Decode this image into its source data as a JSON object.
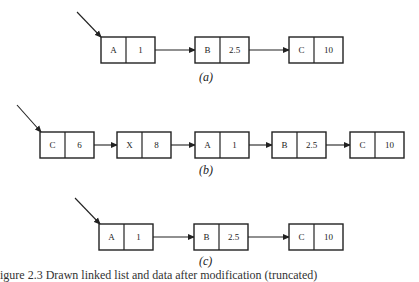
{
  "diagram": {
    "colors": {
      "stroke": "#222222",
      "background": "#ffffff"
    },
    "panels": [
      {
        "label": "(a)",
        "head_pointer": {
          "from": [
            77,
            12
          ],
          "to": [
            101,
            37
          ]
        },
        "row_y": 37,
        "nodes": [
          {
            "key": "A",
            "value": "1",
            "x": 101
          },
          {
            "key": "B",
            "value": "2.5",
            "x": 195
          },
          {
            "key": "C",
            "value": "10",
            "x": 289
          }
        ]
      },
      {
        "label": "(b)",
        "head_pointer": {
          "from": [
            17,
            105
          ],
          "to": [
            41,
            132
          ]
        },
        "row_y": 132,
        "nodes": [
          {
            "key": "C",
            "value": "6",
            "x": 40
          },
          {
            "key": "X",
            "value": "8",
            "x": 117
          },
          {
            "key": "A",
            "value": "1",
            "x": 195
          },
          {
            "key": "B",
            "value": "2.5",
            "x": 272
          },
          {
            "key": "C",
            "value": "10",
            "x": 350
          }
        ]
      },
      {
        "label": "(c)",
        "head_pointer": {
          "from": [
            75,
            198
          ],
          "to": [
            100,
            224
          ]
        },
        "row_y": 224,
        "nodes": [
          {
            "key": "A",
            "value": "1",
            "x": 99
          },
          {
            "key": "B",
            "value": "2.5",
            "x": 194
          },
          {
            "key": "C",
            "value": "10",
            "x": 289
          }
        ]
      }
    ],
    "caption": "igure 2.3  Drawn linked list and data after modification (truncated)"
  }
}
